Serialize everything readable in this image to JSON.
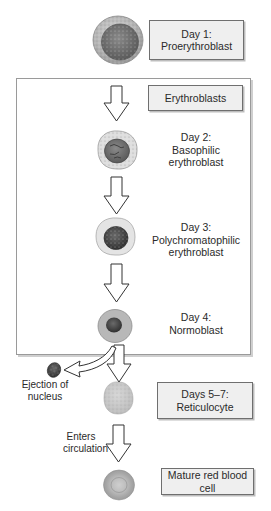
{
  "diagram": {
    "title_box": {
      "line1": "Day 1:",
      "line2": "Proerythroblast"
    },
    "group": {
      "label": "Erythroblasts"
    },
    "stages": [
      {
        "line1": "Day 2:",
        "line2": "Basophilic",
        "line3": "erythroblast"
      },
      {
        "line1": "Day 3:",
        "line2": "Polychromatophilic",
        "line3": "erythroblast"
      },
      {
        "line1": "Day 4:",
        "line2": "Normoblast"
      }
    ],
    "ejection_label": {
      "line1": "Ejection of",
      "line2": "nucleus"
    },
    "reticulocyte_box": {
      "line1": "Days 5–7:",
      "line2": "Reticulocyte"
    },
    "circulation_label": {
      "line1": "Enters",
      "line2": "circulation"
    },
    "mature_box": {
      "line1": "Mature red blood",
      "line2": "cell"
    },
    "cells": [
      {
        "name": "proerythroblast",
        "icon": "proerythroblast-cell-icon"
      },
      {
        "name": "basophilic-erythroblast",
        "icon": "basophilic-erythroblast-cell-icon"
      },
      {
        "name": "polychromatophilic-erythroblast",
        "icon": "polychromatophilic-erythroblast-cell-icon"
      },
      {
        "name": "normoblast",
        "icon": "normoblast-cell-icon"
      },
      {
        "name": "ejected-nucleus",
        "icon": "ejected-nucleus-icon"
      },
      {
        "name": "reticulocyte",
        "icon": "reticulocyte-cell-icon"
      },
      {
        "name": "mature-red-blood-cell",
        "icon": "mature-rbc-cell-icon"
      }
    ],
    "colors": {
      "box_fill": "#efefef",
      "box_border": "#6f6f6f",
      "frame_border": "#9a9a9a",
      "arrow_stroke": "#3a3a3a",
      "cytoplasm": "#b9b9b9",
      "nucleus": "#4a4a4a"
    }
  }
}
